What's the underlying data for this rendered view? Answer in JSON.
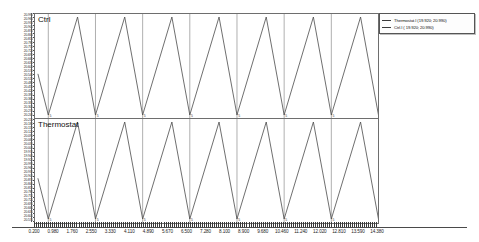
{
  "chart_data": {
    "type": "line",
    "title": "",
    "xlabel": "",
    "ylabel": "",
    "grid": true,
    "legend_position": "top-right-outside",
    "xlim": [
      0.2,
      14.38
    ],
    "xticks": [
      "0.200",
      "0.980",
      "1.760",
      "2.550",
      "3.330",
      "4.110",
      "4.890",
      "5.670",
      "6.500",
      "7.280",
      "8.100",
      "8.900",
      "9.680",
      "10.460",
      "11.240",
      "12.020",
      "12.810",
      "13.590",
      "14.380"
    ],
    "panels": [
      {
        "name": "Ctrl",
        "label": "Ctrl",
        "series_name": "Ctrl.I",
        "waveform": "triangle",
        "line_color": "#4a4a4a",
        "value_range": [
          19.92,
          20.99
        ],
        "cycles": 7,
        "period": 1.95,
        "phase_offset": 0.55
      },
      {
        "name": "Thermostat",
        "label": "Thermostat",
        "series_name": "Thermostat.I",
        "waveform": "triangle",
        "line_color": "#4a4a4a",
        "value_range": [
          19.92,
          20.99
        ],
        "cycles": 7,
        "period": 1.95,
        "phase_offset": 0.55
      }
    ],
    "series": [
      {
        "name": "Thermostat.I",
        "min": 19.92,
        "max": 20.99
      },
      {
        "name": "Ctrl.I",
        "min": 19.92,
        "max": 20.99
      }
    ],
    "yticks_dense": [
      "20.990",
      "20.960",
      "20.930",
      "20.900",
      "20.870",
      "20.840",
      "20.810",
      "20.780",
      "20.750",
      "20.720",
      "20.690",
      "20.660",
      "20.630",
      "20.600",
      "20.570",
      "20.540",
      "20.510",
      "20.480",
      "20.450",
      "20.420",
      "20.390",
      "20.360",
      "20.330",
      "20.300",
      "20.270",
      "20.240",
      "20.210",
      "20.180",
      "20.150",
      "20.120",
      "20.090",
      "20.060",
      "20.030",
      "20.000",
      "19.970",
      "19.940",
      "19.920"
    ]
  },
  "legend": {
    "entries": [
      {
        "label": "Thermostat.I  (19.920;  20.990)",
        "color": "#3b3b3b"
      },
      {
        "label": "Ctrl.I  (  19.920;  20.990)",
        "color": "#3b3b3b"
      }
    ]
  },
  "panel_labels": {
    "ctrl": "Ctrl",
    "thermostat": "Thermostat"
  },
  "inplot_ticks": [
    "5",
    "5",
    "5",
    "5",
    "5",
    "5",
    "5"
  ]
}
